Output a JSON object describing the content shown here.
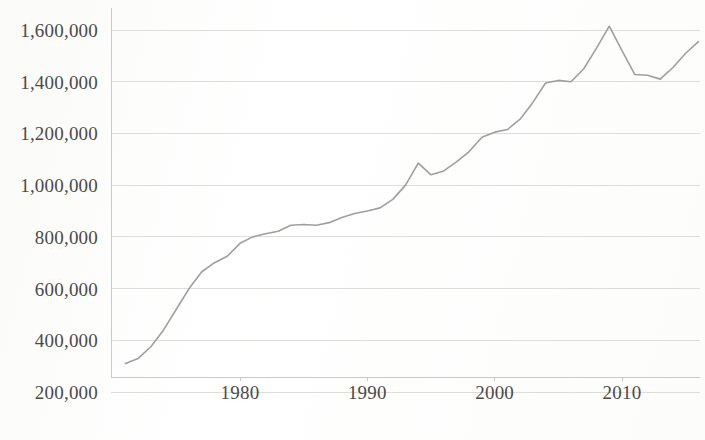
{
  "chart_data": {
    "type": "line",
    "title": "",
    "subtitle": "",
    "xlabel": "",
    "ylabel": "",
    "xlim": [
      1971,
      2016
    ],
    "ylim": [
      200000,
      1650000
    ],
    "grid": true,
    "legend": false,
    "legend_position": "none",
    "line_color": "#9a9a9a",
    "gridline_color": "#d8d8d4",
    "axis_color": "#c9c9c5",
    "background_color": "#fefefe",
    "text_color": "#4a4a4a",
    "y_ticks": [
      200000,
      400000,
      600000,
      800000,
      1000000,
      1200000,
      1400000,
      1600000
    ],
    "y_tick_labels": [
      "200,000",
      "400,000",
      "600,000",
      "800,000",
      "1,000,000",
      "1,200,000",
      "1,400,000",
      "1,600,000"
    ],
    "x_ticks": [
      1980,
      1990,
      2000,
      2010
    ],
    "x_tick_labels": [
      "1980",
      "1990",
      "2000",
      "2010"
    ],
    "series": [
      {
        "name": "series-1",
        "x": [
          1971,
          1972,
          1973,
          1974,
          1975,
          1976,
          1977,
          1978,
          1979,
          1980,
          1981,
          1982,
          1983,
          1984,
          1985,
          1986,
          1987,
          1988,
          1989,
          1990,
          1991,
          1992,
          1993,
          1994,
          1995,
          1996,
          1997,
          1998,
          1999,
          2000,
          2001,
          2002,
          2003,
          2004,
          2005,
          2006,
          2007,
          2008,
          2009,
          2010,
          2011,
          2012,
          2013,
          2014,
          2015,
          2016
        ],
        "values": [
          310000,
          330000,
          375000,
          440000,
          520000,
          600000,
          665000,
          700000,
          725000,
          775000,
          800000,
          812000,
          822000,
          845000,
          848000,
          845000,
          855000,
          875000,
          890000,
          900000,
          912000,
          945000,
          1000000,
          1085000,
          1040000,
          1055000,
          1090000,
          1130000,
          1185000,
          1205000,
          1215000,
          1255000,
          1320000,
          1395000,
          1405000,
          1400000,
          1450000,
          1530000,
          1615000,
          1520000,
          1428000,
          1425000,
          1410000,
          1455000,
          1510000,
          1555000
        ]
      }
    ]
  },
  "axes": {
    "y_axis_name": "y-axis",
    "x_axis_name": "x-axis"
  }
}
